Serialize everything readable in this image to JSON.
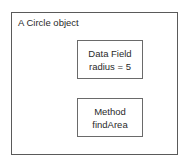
{
  "diagram": {
    "type": "object-structure",
    "outer": {
      "title": "A Circle object"
    },
    "boxes": [
      {
        "kind": "data-field",
        "lines": [
          "Data Field",
          "radius = 5"
        ]
      },
      {
        "kind": "method",
        "lines": [
          "Method",
          "findArea"
        ]
      }
    ]
  }
}
